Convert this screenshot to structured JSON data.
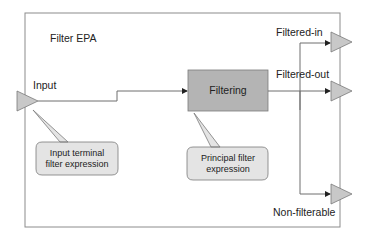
{
  "diagram": {
    "title": "Filter EPA",
    "colors": {
      "terminal_fill": "#c8c8c8",
      "box_fill": "#b4b4b4",
      "callout_fill": "#e4e4e4",
      "line": "#6e6e6e",
      "frame": "#8c8c8c"
    },
    "input": {
      "label": "Input"
    },
    "process": {
      "label": "Filtering"
    },
    "outputs": [
      {
        "label": "Filtered-in"
      },
      {
        "label": "Filtered-out"
      },
      {
        "label": "Non-filterable"
      }
    ],
    "callouts": [
      {
        "lines": [
          "Input terminal",
          "filter expression"
        ],
        "target": "Input"
      },
      {
        "lines": [
          "Principal filter",
          "expression"
        ],
        "target": "Filtering"
      }
    ]
  }
}
